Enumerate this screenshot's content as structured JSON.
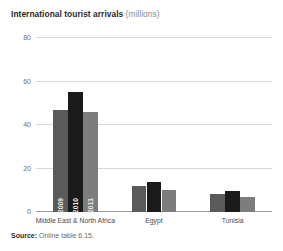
{
  "title": {
    "main": "International tourist arrivals",
    "unit": "(millions)"
  },
  "source": {
    "key": "Source:",
    "value": "Online table 6.15."
  },
  "colors": {
    "series_2009": "#5a5a5a",
    "series_2010": "#1a1a1a",
    "series_2011": "#7d7d7d",
    "gridline": "#d8d8d8",
    "baseline": "#9a9a9a",
    "title_main": "#2b2b2b",
    "title_unit": "#8c8c8c",
    "tick_text": "#6f6f6f",
    "category_text": "#4a4a4a",
    "year_label_text": "#e9e9e9"
  },
  "chart_data": {
    "type": "bar",
    "title": "International tourist arrivals (millions)",
    "xlabel": "",
    "ylabel": "",
    "ylim": [
      0,
      80
    ],
    "yticks": [
      0,
      20,
      40,
      60,
      80
    ],
    "ytick_labels": [
      "0",
      "20",
      "40",
      "60",
      "80"
    ],
    "grid": true,
    "legend": "in-bar",
    "categories": [
      "Middle East & North Africa",
      "Egypt",
      "Tunisia"
    ],
    "series": [
      {
        "name": "2009",
        "color": "#5a5a5a",
        "values": [
          47,
          12,
          8.5
        ]
      },
      {
        "name": "2010",
        "color": "#1a1a1a",
        "values": [
          55,
          14,
          9.5
        ]
      },
      {
        "name": "2011",
        "color": "#7d7d7d",
        "values": [
          46,
          10,
          7
        ]
      }
    ]
  }
}
